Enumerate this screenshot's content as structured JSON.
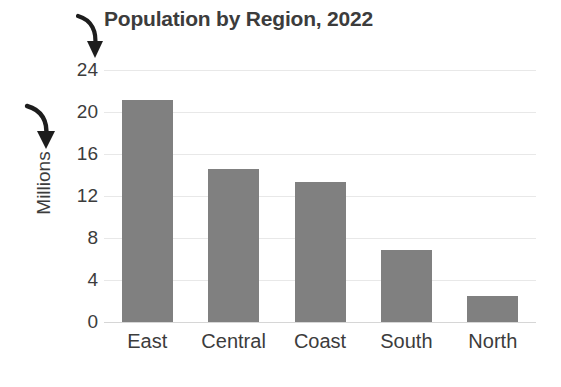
{
  "chart_data": {
    "type": "bar",
    "title": "Population by Region, 2022",
    "xlabel": "",
    "ylabel": "Millions",
    "categories": [
      "East",
      "Central",
      "Coast",
      "South",
      "North"
    ],
    "values": [
      21.1,
      14.6,
      13.3,
      6.9,
      2.5
    ],
    "ylim": [
      0,
      24
    ],
    "ytick_values": [
      0,
      4,
      8,
      12,
      16,
      20,
      24
    ],
    "ytick_labels": [
      "0",
      "4",
      "8",
      "12",
      "16",
      "20",
      "24"
    ],
    "grid": true,
    "legend": false,
    "legend_position": "none",
    "bar_color": "#808080",
    "gridline_color": "#e8e8e8",
    "text_color": "#3c3c3c",
    "background_color": "#ffffff",
    "annotations": [
      {
        "name": "arrow-to-axis-maximum",
        "target": "24",
        "shape": "curved-down-arrow"
      },
      {
        "name": "arrow-to-axis-title",
        "target": "Millions",
        "shape": "curved-down-arrow"
      }
    ]
  }
}
